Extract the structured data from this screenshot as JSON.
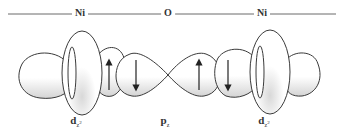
{
  "diagram": {
    "axis_line": {
      "x1": 8,
      "x2": 336,
      "y": 14,
      "color": "#444444"
    },
    "atoms": [
      {
        "label": "Ni",
        "x": 80
      },
      {
        "label": "O",
        "x": 168
      },
      {
        "label": "Ni",
        "x": 262
      }
    ],
    "orbitals": [
      {
        "label_main": "d",
        "label_sub": "z",
        "label_sup": "2",
        "x": 76,
        "atom": "Ni",
        "type": "d_z2"
      },
      {
        "label_main": "p",
        "label_sub": "z",
        "label_sup": "",
        "x": 165,
        "atom": "O",
        "type": "p_z"
      },
      {
        "label_main": "d",
        "label_sub": "z",
        "label_sup": "2",
        "x": 264,
        "atom": "Ni",
        "type": "d_z2"
      }
    ],
    "spin_arrows": [
      {
        "x": 109,
        "direction": "up"
      },
      {
        "x": 136,
        "direction": "down"
      },
      {
        "x": 199,
        "direction": "up"
      },
      {
        "x": 228,
        "direction": "down"
      }
    ],
    "colors": {
      "outline": "#3a3a3a",
      "fill": "#ffffff",
      "shade": "#d9d9d9"
    }
  }
}
